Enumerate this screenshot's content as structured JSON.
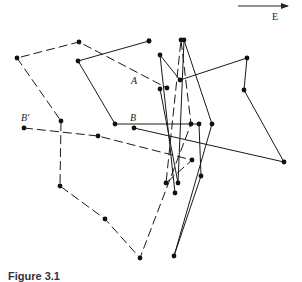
{
  "diagram": {
    "direction_arrow": {
      "label": "E",
      "x1": 238,
      "y1": 6,
      "x2": 288,
      "y2": 6
    },
    "labels": [
      {
        "id": "A",
        "text": "A",
        "x": 131,
        "y": 75
      },
      {
        "id": "B",
        "text": "B",
        "x": 130,
        "y": 112
      },
      {
        "id": "B_prime",
        "text": "B′",
        "x": 21,
        "y": 112
      }
    ],
    "solid_path": {
      "style": "solid",
      "points": [
        [
          160,
          89
        ],
        [
          178,
          183
        ],
        [
          184,
          40
        ],
        [
          212,
          124
        ],
        [
          174,
          256
        ],
        [
          201,
          176
        ],
        [
          199,
          124
        ],
        [
          115,
          124
        ],
        [
          78,
          61
        ],
        [
          149,
          41
        ],
        [
          149,
          41
        ]
      ]
    },
    "solid_path_2": {
      "style": "solid",
      "points": [
        [
          134,
          128
        ],
        [
          284,
          162
        ],
        [
          244,
          90
        ],
        [
          247,
          58
        ],
        [
          180,
          80
        ],
        [
          160,
          55
        ],
        [
          175,
          193
        ]
      ]
    },
    "dashed_path": {
      "style": "dashed",
      "points": [
        [
          24,
          128
        ],
        [
          98,
          136
        ],
        [
          192,
          160
        ],
        [
          166,
          183
        ],
        [
          181,
          40
        ],
        [
          191,
          124
        ],
        [
          140,
          258
        ],
        [
          105,
          219
        ],
        [
          60,
          186
        ],
        [
          61,
          121
        ],
        [
          17,
          58
        ],
        [
          79,
          42
        ],
        [
          167,
          88
        ]
      ]
    },
    "caption": "Figure 3.1"
  }
}
